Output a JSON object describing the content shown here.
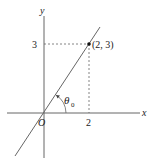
{
  "diagram": {
    "axes": {
      "x_label": "x",
      "y_label": "y",
      "origin_label": "O"
    },
    "ticks": {
      "x_tick": "2",
      "y_tick": "3"
    },
    "point": {
      "label": "(2, 3)",
      "x": 2,
      "y": 3
    },
    "angle": {
      "label": "θ",
      "subscript": "0"
    },
    "colors": {
      "stroke": "#555555",
      "text": "#222222"
    }
  }
}
